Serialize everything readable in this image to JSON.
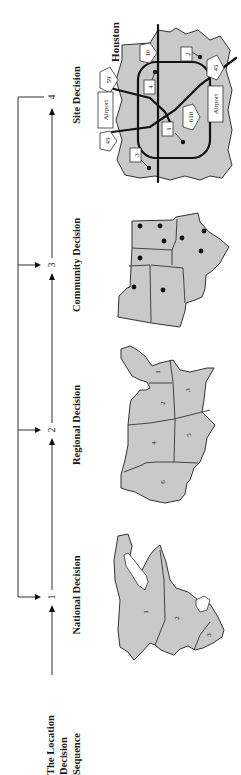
{
  "diagram": {
    "title_lines": [
      "The Location",
      "Decision",
      "Sequence"
    ],
    "orientation": "rotated 90° counter-clockwise",
    "fill_color": "#c9c9c9",
    "steps": [
      {
        "number": "1",
        "label": "National Decision",
        "map": "Canada + USA + Mexico (North America)",
        "region_labels": [
          "1",
          "2",
          "3"
        ]
      },
      {
        "number": "2",
        "label": "Regional Decision",
        "map": "United States regions",
        "region_labels": [
          "1",
          "2",
          "3",
          "4",
          "5",
          "6"
        ]
      },
      {
        "number": "3",
        "label": "Community Decision",
        "map": "States with community dots"
      },
      {
        "number": "4",
        "label": "Site Decision",
        "map": "Houston site map"
      }
    ],
    "site_map": {
      "city": "Houston",
      "highways": [
        "59",
        "10",
        "45",
        "45",
        "610"
      ],
      "airports": [
        "Airport",
        "Airport"
      ],
      "sites": [
        "1",
        "2",
        "3",
        "4"
      ]
    }
  }
}
